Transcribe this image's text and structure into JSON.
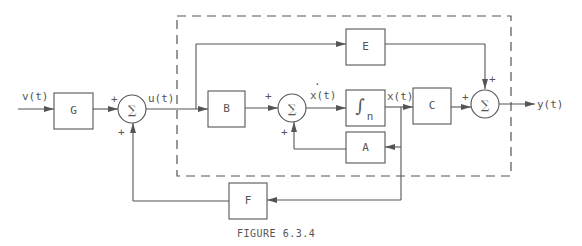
{
  "figure": {
    "caption": "FIGURE 6.3.4"
  },
  "signals": {
    "input": "v(t)",
    "control": "u(t)",
    "state_derivative": "x(t)",
    "state_derivative_dot": "·",
    "state": "x(t)",
    "output": "y(t)"
  },
  "blocks": {
    "G": "G",
    "B": "B",
    "integrator_symbol": "∫",
    "integrator_sub": "n",
    "A": "A",
    "C": "C",
    "E": "E",
    "F": "F"
  },
  "summing_junctions": {
    "symbol": "∑",
    "sign_plus": "+"
  }
}
